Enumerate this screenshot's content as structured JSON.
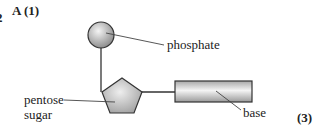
{
  "question": {
    "number_fragment": "2",
    "answer_label": "A (1)",
    "marks": "(3)"
  },
  "diagram": {
    "labels": {
      "phosphate": "phosphate",
      "pentose": "pentose",
      "sugar": "sugar",
      "base": "base"
    },
    "colors": {
      "outline": "#333333",
      "fill_light": "#f2f2f2",
      "fill_dark": "#9a9a9a"
    }
  }
}
